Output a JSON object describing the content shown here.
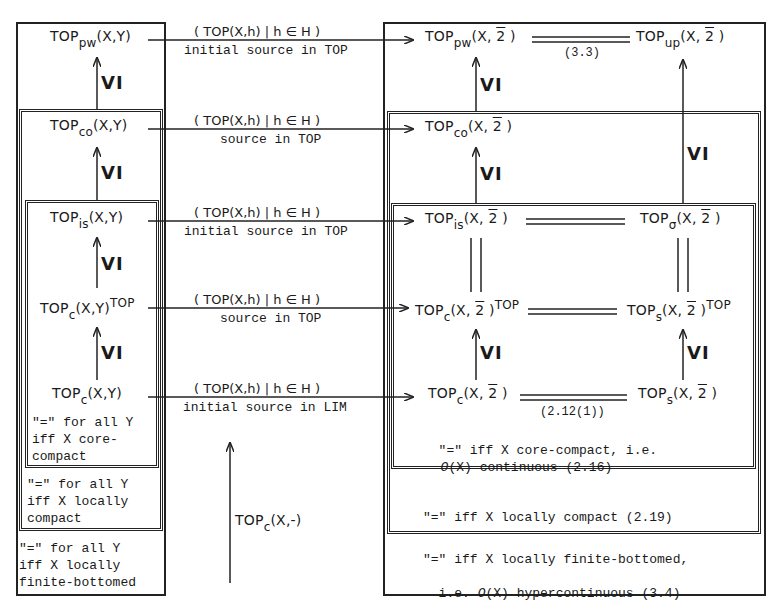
{
  "diagram": {
    "left_column": {
      "terms": [
        {
          "base": "TOP",
          "sub": "pw",
          "args": "(X,Y)",
          "sup": ""
        },
        {
          "base": "TOP",
          "sub": "co",
          "args": "(X,Y)",
          "sup": ""
        },
        {
          "base": "TOP",
          "sub": "is",
          "args": "(X,Y)",
          "sup": ""
        },
        {
          "base": "TOP",
          "sub": "c",
          "args": "(X,Y)",
          "sup": "TOP"
        },
        {
          "base": "TOP",
          "sub": "c",
          "args": "(X,Y)",
          "sup": ""
        }
      ],
      "inclusion_label": "VI",
      "notes": {
        "inner": "\"=\" for all Y\niff X core-\ncompact",
        "middle": "\"=\" for all Y\niff X locally\ncompact",
        "outer": "\"=\" for all Y\niff X locally\nfinite-bottomed"
      }
    },
    "middle_column": {
      "sources": [
        {
          "family": "( TOP(X,h) | h ∈ H )",
          "label": "initial source in TOP"
        },
        {
          "family": "( TOP(X,h) | h ∈ H )",
          "label": "source in TOP"
        },
        {
          "family": "( TOP(X,h) | h ∈ H )",
          "label": "initial source in TOP"
        },
        {
          "family": "( TOP(X,h) | h ∈ H )",
          "label": "source in TOP"
        },
        {
          "family": "( TOP(X,h) | h ∈ H )",
          "label": "initial source in LIM"
        }
      ],
      "functor": {
        "base": "TOP",
        "sub": "c",
        "args": "(X,-)"
      }
    },
    "right_column": {
      "terms": {
        "pw": {
          "base": "TOP",
          "sub": "pw",
          "args_pre": "(X, ",
          "bar": "2",
          "args_post": " )",
          "sup": ""
        },
        "up": {
          "base": "TOP",
          "sub": "up",
          "args_pre": "(X, ",
          "bar": "2",
          "args_post": " )",
          "sup": ""
        },
        "co": {
          "base": "TOP",
          "sub": "co",
          "args_pre": "(X, ",
          "bar": "2",
          "args_post": " )",
          "sup": ""
        },
        "is": {
          "base": "TOP",
          "sub": "is",
          "args_pre": "(X, ",
          "bar": "2",
          "args_post": " )",
          "sup": ""
        },
        "sigma": {
          "base": "TOP",
          "sub": "σ",
          "args_pre": "(X, ",
          "bar": "2",
          "args_post": " )",
          "sup": ""
        },
        "c_top": {
          "base": "TOP",
          "sub": "c",
          "args_pre": "(X, ",
          "bar": "2",
          "args_post": " )",
          "sup": "TOP"
        },
        "s_top": {
          "base": "TOP",
          "sub": "s",
          "args_pre": "(X, ",
          "bar": "2",
          "args_post": " )",
          "sup": "TOP"
        },
        "c": {
          "base": "TOP",
          "sub": "c",
          "args_pre": "(X, ",
          "bar": "2",
          "args_post": " )",
          "sup": ""
        },
        "s": {
          "base": "TOP",
          "sub": "s",
          "args_pre": "(X, ",
          "bar": "2",
          "args_post": " )",
          "sup": ""
        }
      },
      "inclusion_label": "VI",
      "equality_refs": {
        "pw_up": "(3.3)",
        "c_s": "(2.12(1))"
      },
      "notes": {
        "inner_line1": "\"=\" iff X core-compact, i.e.",
        "inner_line2_symbol": "O",
        "inner_line2_rest": "(X) continuous (2.16)",
        "middle": "\"=\" iff X locally compact (2.19)",
        "outer_line1": "\"=\" iff X locally finite-bottomed,",
        "outer_line2_pre": "i.e. ",
        "outer_line2_symbol": "O",
        "outer_line2_rest": "(X) hypercontinuous (3.4)"
      }
    }
  }
}
